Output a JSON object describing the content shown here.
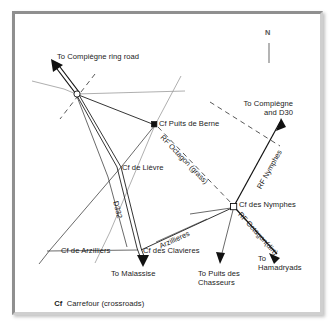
{
  "figure": {
    "kind": "map-diagram",
    "caption_legend_abbrev": "Cf",
    "caption_legend_text": "Carrefour (crossroads)",
    "compass_label": "N"
  },
  "colors": {
    "background": "#ffffff",
    "frame": "#b9b9b9",
    "ink": "#111111",
    "pale_road": "#9a9a9a",
    "dashed_road": "#3a3a3a",
    "compass": "#8d8d8d"
  },
  "nodes": [
    {
      "id": "ring-junction",
      "label": "",
      "marker": "open-circle",
      "x": 61,
      "y": 80
    },
    {
      "id": "puits-de-berne",
      "label": "Cf Puits de Berne",
      "marker": "filled-square",
      "x": 140,
      "y": 111
    },
    {
      "id": "de-lievre",
      "label": "Cf de Lièvre",
      "marker": "crossing",
      "x": 105,
      "y": 155
    },
    {
      "id": "des-clavieres",
      "label": "Cf des Clavieres",
      "marker": "crossing",
      "x": 126,
      "y": 237
    },
    {
      "id": "de-arzilliers",
      "label": "Cf de Arzilliers",
      "marker": "crossing",
      "x": 46,
      "y": 237
    },
    {
      "id": "des-nymphes",
      "label": "Cf des Nymphes",
      "marker": "open-square",
      "x": 219,
      "y": 193
    }
  ],
  "destinations": [
    {
      "id": "compiegne-ring-road",
      "label": "To Compiègne ring road"
    },
    {
      "id": "compiegne-and-d30",
      "label": "To Compiègne\nand D30"
    },
    {
      "id": "malassise",
      "label": "To Malassise"
    },
    {
      "id": "puits-des-chasseurs",
      "label": "To Puits des\nChasseurs"
    },
    {
      "id": "hamadryads",
      "label": "To\nHamadryads"
    }
  ],
  "route_labels": [
    {
      "id": "rf-octagon-grass",
      "label": "RF Octagon (grass)"
    },
    {
      "id": "rf-nymphes",
      "label": "RF Nymphes"
    },
    {
      "id": "rf-octagon-dirt",
      "label": "RF Octagon(dirt)"
    },
    {
      "id": "d332",
      "label": "D332"
    },
    {
      "id": "arzillieres",
      "label": "Arzillieres"
    }
  ]
}
